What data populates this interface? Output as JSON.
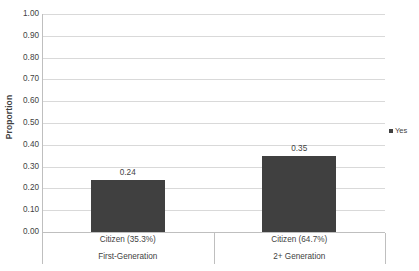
{
  "chart_data": {
    "type": "bar",
    "title": "",
    "xlabel": "",
    "ylabel": "Proportion",
    "ylim": [
      0,
      1.0
    ],
    "ytick_step": 0.1,
    "grid": true,
    "legend_position": "right",
    "categories": [
      "Citizen (35.3%)",
      "Citizen (64.7%)"
    ],
    "groups": [
      "First-Generation",
      "2+ Generation"
    ],
    "series": [
      {
        "name": "Yes",
        "color": "#404040",
        "values": [
          0.24,
          0.35
        ],
        "value_labels": [
          "0.24",
          "0.35"
        ]
      }
    ],
    "ytick_labels": [
      "1.00",
      "0.90",
      "0.80",
      "0.70",
      "0.60",
      "0.50",
      "0.40",
      "0.30",
      "0.20",
      "0.10",
      "0.00"
    ],
    "ytick_values": [
      1.0,
      0.9,
      0.8,
      0.7,
      0.6,
      0.5,
      0.4,
      0.3,
      0.2,
      0.1,
      0.0
    ],
    "colors": {
      "bar": "#404040",
      "gridline": "#d9d9d9",
      "axis": "#bfbfbf",
      "text": "#3f3f3f",
      "background": "#ffffff"
    }
  },
  "legend": {
    "entries": [
      {
        "label": "Yes",
        "color": "#404040"
      }
    ]
  }
}
